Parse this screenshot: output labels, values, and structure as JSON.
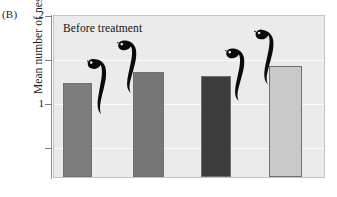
{
  "panel": {
    "label": "(B)"
  },
  "chart_data": {
    "type": "bar",
    "title": "",
    "annotation": "Before treatment",
    "xlabel": "",
    "ylabel": "Mean number of nests per male",
    "categories": [
      "Group 1 bar A",
      "Group 1 bar B",
      "Group 2 bar A",
      "Group 2 bar B"
    ],
    "values": [
      1.43,
      1.52,
      1.49,
      1.57
    ],
    "bar_colors": [
      "#7c7c7c",
      "#767676",
      "#3c3c3c",
      "#c9c9c9"
    ],
    "ylim": [
      0.625,
      2.0
    ],
    "yticks": [
      2,
      1.75,
      1.5,
      1.25
    ],
    "ytick_labels": [
      "2",
      "",
      "1",
      ""
    ],
    "ytick_labels_shown": [
      "2",
      "1"
    ],
    "grid": true,
    "gridline_values": [
      1.75,
      1.25,
      0.875
    ],
    "legend": "none",
    "bars": [
      {
        "name": "bar-1",
        "value": 1.43,
        "color": "#7c7c7c",
        "left_px": 62,
        "width_px": 29,
        "top_px": 72
      },
      {
        "name": "bar-2",
        "value": 1.52,
        "color": "#767676",
        "left_px": 132,
        "width_px": 31,
        "top_px": 56
      },
      {
        "name": "bar-3",
        "value": 1.49,
        "color": "#3c3c3c",
        "left_px": 200,
        "width_px": 30,
        "top_px": 62
      },
      {
        "name": "bar-4",
        "value": 1.57,
        "color": "#c9c9c9",
        "left_px": 268,
        "width_px": 33,
        "top_px": 47
      }
    ],
    "decorations": [
      {
        "name": "widowbird-silhouette-1",
        "perched_on": "bar-1"
      },
      {
        "name": "widowbird-silhouette-2",
        "perched_on": "bar-2"
      },
      {
        "name": "widowbird-silhouette-3",
        "perched_on": "bar-3"
      },
      {
        "name": "widowbird-silhouette-4",
        "perched_on": "bar-4"
      }
    ]
  },
  "axis": {
    "tick_top_label": "2",
    "tick_mid_label": "1"
  }
}
